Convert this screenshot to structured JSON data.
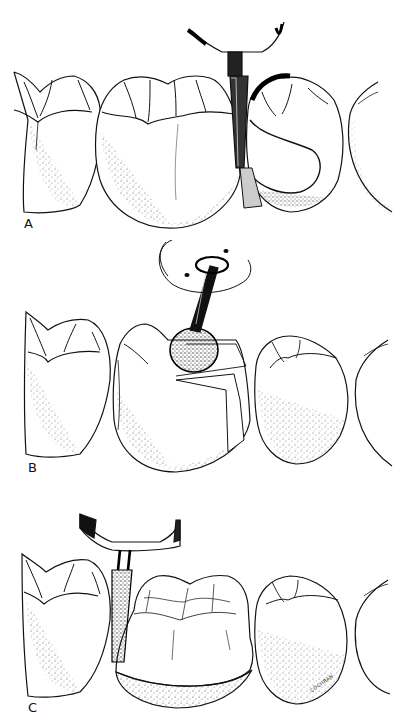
{
  "figure": {
    "panels": [
      {
        "label": "A",
        "instrument": "diamond-bur-with-matrix-band",
        "description": "Proximal reduction with tapered bur; adjacent tooth protected by metal matrix"
      },
      {
        "label": "B",
        "instrument": "wheel-diamond",
        "description": "Occlusal reduction with wheel-shaped diamond; rotation arrow shown"
      },
      {
        "label": "C",
        "instrument": "tapered-cylinder-diamond",
        "description": "Axial reduction of crown preparation with shoulder margin"
      }
    ],
    "signature": "COCHRAN",
    "colors": {
      "ink": "#111111",
      "background": "#ffffff",
      "stipple": "#555555"
    }
  }
}
